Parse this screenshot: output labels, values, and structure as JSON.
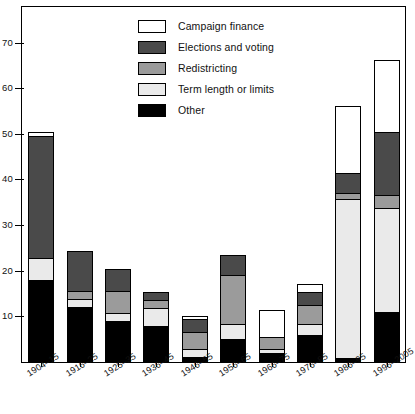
{
  "chart_data": {
    "type": "bar",
    "subtype": "stacked-vertical",
    "title": "",
    "subtitle": "",
    "xlabel": "",
    "ylabel": "",
    "ylim": [
      0,
      78
    ],
    "yticks": [
      10,
      20,
      30,
      40,
      50,
      60,
      70
    ],
    "ytick_labels": [
      "10",
      "20",
      "30",
      "40",
      "50",
      "60",
      "70"
    ],
    "grid": false,
    "legend_position": "top-center",
    "categories": [
      "1904–15",
      "1916–25",
      "1925–35",
      "1936–45",
      "1946–55",
      "1956–65",
      "1966–75",
      "1976–85",
      "1986–95",
      "1996–2005"
    ],
    "series": [
      {
        "name": "Other",
        "color": "#000000",
        "values": [
          18,
          12,
          9,
          8,
          1,
          5,
          2,
          6,
          0.8,
          11
        ]
      },
      {
        "name": "Term length or limits",
        "color": "#eaeaea",
        "values": [
          5,
          2,
          2,
          4,
          2,
          3.5,
          1,
          2.5,
          35.2,
          23
        ]
      },
      {
        "name": "Redistricting",
        "color": "#9b9b9b",
        "values": [
          0,
          2,
          5,
          2,
          4,
          11,
          3,
          4.5,
          1.5,
          3
        ]
      },
      {
        "name": "Elections and voting",
        "color": "#4a4a4a",
        "values": [
          27,
          9,
          5,
          2,
          3,
          4.5,
          0,
          3,
          4.5,
          14
        ]
      },
      {
        "name": "Campaign finance",
        "color": "#ffffff",
        "values": [
          1,
          0,
          0,
          0,
          1,
          0,
          6,
          2,
          15,
          16
        ]
      }
    ],
    "totals": [
      51,
      25,
      21,
      16,
      11,
      24,
      12,
      18,
      57,
      67
    ]
  },
  "legend": {
    "items": [
      {
        "label": "Campaign finance",
        "swatch": "#ffffff"
      },
      {
        "label": "Elections and voting",
        "swatch": "#4a4a4a"
      },
      {
        "label": "Redistricting",
        "swatch": "#9b9b9b"
      },
      {
        "label": "Term length or limits",
        "swatch": "#eaeaea"
      },
      {
        "label": "Other",
        "swatch": "#000000"
      }
    ]
  }
}
